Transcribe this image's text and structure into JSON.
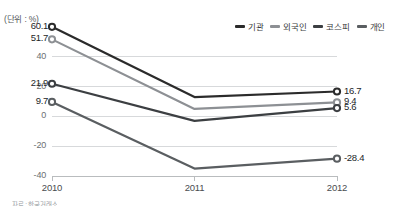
{
  "unit_label": "(단위 : %)",
  "legend": {
    "position": "top-right",
    "items": [
      {
        "label": "기관",
        "color": "#2b2b2b"
      },
      {
        "label": "외국인",
        "color": "#8d9094"
      },
      {
        "label": "코스피",
        "color": "#3c3f42"
      },
      {
        "label": "개인",
        "color": "#5a5e61"
      }
    ]
  },
  "footnote": "자료 : 한국거래소",
  "chart_data": {
    "type": "line",
    "title": "",
    "subtitle": "",
    "xlabel": "",
    "ylabel": "",
    "unit": "%",
    "x": [
      "2010",
      "2011",
      "2012"
    ],
    "categories": [
      "2010",
      "2011",
      "2012"
    ],
    "ylim": [
      -40,
      60
    ],
    "yticks": [
      40,
      20,
      0,
      -20,
      -40
    ],
    "ytick_labels": [
      "40",
      "20",
      "0",
      "-20",
      "-40"
    ],
    "grid": true,
    "legend_position": "top-right",
    "markers": "open-circle",
    "series": [
      {
        "name": "기관",
        "color": "#2b2b2b",
        "values": [
          60.1,
          13.0,
          16.7
        ],
        "start_label": "60.1",
        "end_label": "16.7"
      },
      {
        "name": "외국인",
        "color": "#8d9094",
        "values": [
          51.7,
          5.0,
          9.4
        ],
        "start_label": "51.7",
        "end_label": "9.4"
      },
      {
        "name": "코스피",
        "color": "#3c3f42",
        "values": [
          21.9,
          -3.0,
          5.6
        ],
        "start_label": "21.9",
        "end_label": "5.6"
      },
      {
        "name": "개인",
        "color": "#5a5e61",
        "values": [
          9.7,
          -35.0,
          -28.4
        ],
        "start_label": "9.7",
        "end_label": "-28.4"
      }
    ],
    "value_labels_left": [
      "60.1",
      "51.7",
      "21.9",
      "9.7"
    ],
    "value_labels_right": [
      "16.7",
      "9.4",
      "5.6",
      "-28.4"
    ]
  }
}
